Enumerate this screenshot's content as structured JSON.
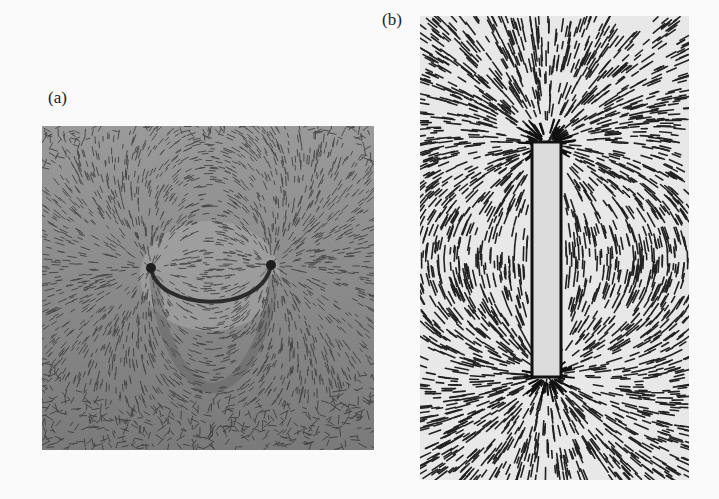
{
  "figure": {
    "panels": [
      {
        "label": "(a)",
        "subject": "horseshoe-magnet-iron-filings",
        "background": "#8a8a8a"
      },
      {
        "label": "(b)",
        "subject": "bar-magnet-iron-filings",
        "background": "#e6e6e6"
      }
    ]
  }
}
